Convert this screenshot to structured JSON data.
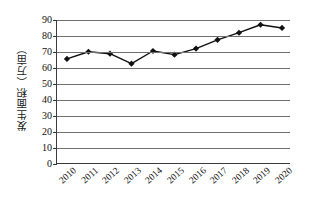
{
  "chart_data": {
    "type": "line",
    "title": "",
    "xlabel": "",
    "ylabel": "发生面积（万亩）",
    "categories": [
      "2010",
      "2011",
      "2012",
      "2013",
      "2014",
      "2015",
      "2016",
      "2017",
      "2018",
      "2019",
      "2020"
    ],
    "values": [
      65.5,
      70.0,
      68.8,
      62.5,
      70.5,
      68.2,
      72.0,
      77.5,
      82.0,
      87.0,
      85.0
    ],
    "series": [
      {
        "name": "发生面积",
        "values": [
          65.5,
          70.0,
          68.8,
          62.5,
          70.5,
          68.2,
          72.0,
          77.5,
          82.0,
          87.0,
          85.0
        ]
      }
    ],
    "ylim": [
      0,
      90
    ],
    "ytick_step": 10,
    "yticks": [
      "0",
      "10",
      "20",
      "30",
      "40",
      "50",
      "60",
      "70",
      "80",
      "90"
    ],
    "grid": "horizontal",
    "legend": "none",
    "marker": "diamond",
    "line_color": "#111111",
    "marker_color": "#111111",
    "gridline_color": "#6f6f6f",
    "axis_color": "#3a3a3a",
    "background_color": "#ffffff"
  }
}
